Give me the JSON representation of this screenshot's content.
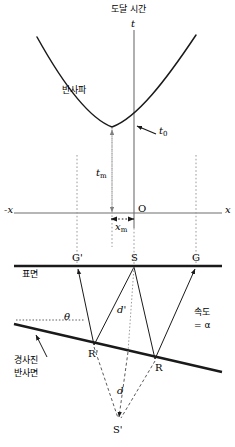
{
  "figure": {
    "title": "도달 시간",
    "width": 235,
    "height": 447,
    "background": "#ffffff",
    "line_color": "#1a1a1a",
    "dotted_color": "#9a9a9a",
    "axis_color": "#6e6e6e"
  },
  "upper_plot": {
    "title": "도달 시간",
    "t_axis_label": "t",
    "x_axis_label_right": "x",
    "x_axis_label_left": "-x",
    "origin_label": "O",
    "curve_label": "반사파",
    "t0_label": "t",
    "t0_sub": "0",
    "tm_label": "t",
    "tm_sub": "m",
    "xm_label": "x",
    "xm_sub": "m",
    "curve_type": "hyperbola",
    "curve_min_x_px": 112,
    "curve_min_t_px": 127,
    "t_axis_x_px": 134,
    "x_axis_y_px": 213
  },
  "lower_diagram": {
    "surface_label": "표면",
    "surface_points": [
      "G'",
      "S",
      "G"
    ],
    "reflector_points": [
      "R'",
      "R"
    ],
    "image_source_label": "S'",
    "depth_label": "d",
    "depth_prime_label": "d'",
    "angle_label": "θ",
    "velocity_label_line1": "속도",
    "velocity_label_line2": "= α",
    "reflector_label_line1": "경사진",
    "reflector_label_line2": "반사면",
    "surface_y_px": 266,
    "geophone_gprime_x_px": 77,
    "source_s_x_px": 134,
    "geophone_g_x_px": 196,
    "reflector_rprime_x_px": 94,
    "reflector_rprime_y_px": 345,
    "reflector_r_x_px": 155,
    "reflector_r_y_px": 359,
    "image_source_x_px": 118,
    "image_source_y_px": 425
  }
}
